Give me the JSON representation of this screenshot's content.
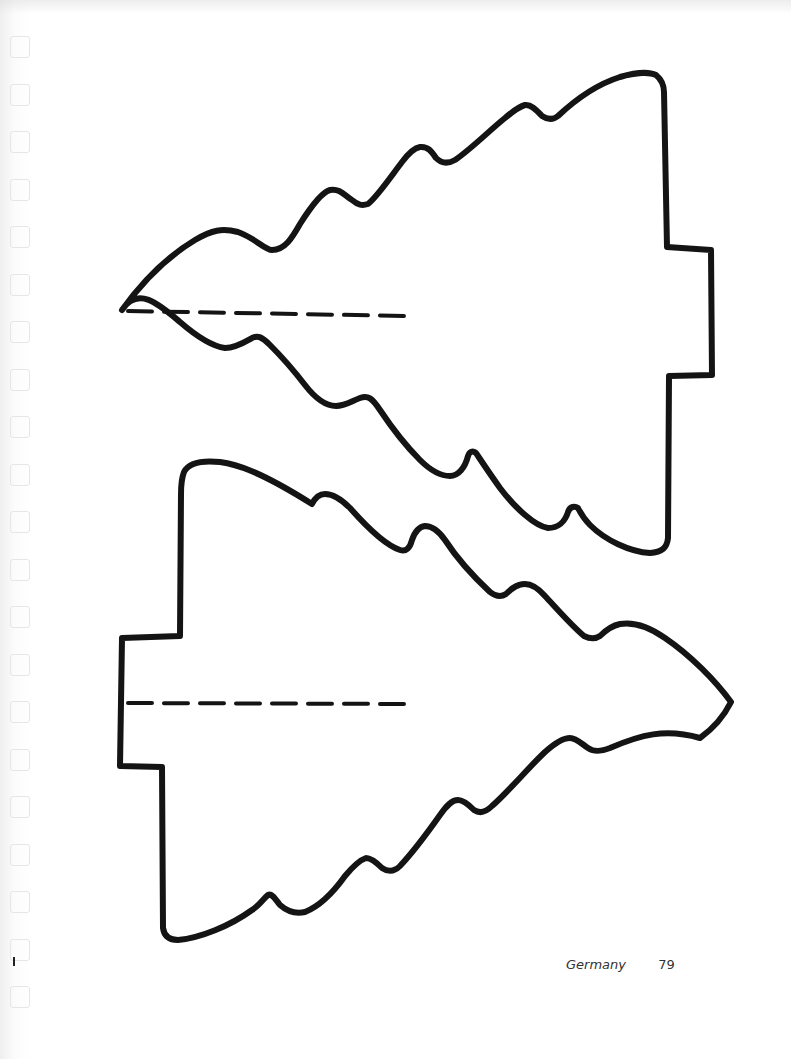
{
  "page": {
    "footer": {
      "section": "Germany",
      "page_number": "79"
    },
    "punch_hole_count": 21,
    "ink_color": "#141414",
    "paper_color": "#ffffff"
  },
  "templates": [
    {
      "name": "tree-template-top",
      "shape": "fir tree cut-out pattern",
      "tip_direction": "left",
      "fold_line": "dashed"
    },
    {
      "name": "tree-template-bottom",
      "shape": "fir tree cut-out pattern",
      "tip_direction": "right",
      "fold_line": "dashed"
    }
  ]
}
